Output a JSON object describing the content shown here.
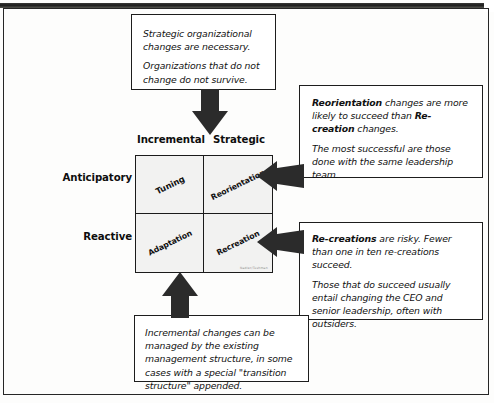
{
  "callouts": {
    "top": {
      "name": "strategic-change-note",
      "paragraphs": [
        "Strategic organizational changes are necessary.",
        "Organizations that do not change do not survive."
      ]
    },
    "right_upper": {
      "name": "reorientation-note",
      "lead_bold": "Reorientation",
      "lead_rest": " changes are more likely to succeed than ",
      "second_bold": "Re-creation",
      "second_rest": " changes.",
      "paragraph2": "The most successful are those done with the same leadership team."
    },
    "right_lower": {
      "name": "re-creation-note",
      "lead_bold": "Re-creations",
      "lead_rest": " are risky. Fewer than one in ten re-creations succeed.",
      "paragraph2": "Those that do succeed usually entail changing the CEO and senior leadership, often with outsiders."
    },
    "bottom": {
      "name": "incremental-change-note",
      "paragraphs": [
        "Incremental changes can be managed by the existing management structure, in some cases with a special \"transition structure\" appended."
      ]
    }
  },
  "matrix": {
    "columns": [
      "Incremental",
      "Strategic"
    ],
    "rows": [
      "Anticipatory",
      "Reactive"
    ],
    "cells": [
      {
        "label": "Tuning",
        "row": "Anticipatory",
        "column": "Incremental"
      },
      {
        "label": "Reorientation",
        "row": "Anticipatory",
        "column": "Strategic"
      },
      {
        "label": "Adaptation",
        "row": "Reactive",
        "column": "Incremental"
      },
      {
        "label": "Recreation",
        "row": "Reactive",
        "column": "Strategic"
      }
    ],
    "credit": "Nadler/Tushman",
    "cell_fill": "#f2f2f1",
    "line_color": "#1b1b1b"
  },
  "arrows": {
    "down": {
      "name": "arrow-down-to-strategic",
      "color": "#2b2b2b"
    },
    "up": {
      "name": "arrow-up-to-adaptation",
      "color": "#2b2b2b"
    },
    "left_upper": {
      "name": "arrow-left-to-reorientation",
      "color": "#2b2b2b"
    },
    "left_lower": {
      "name": "arrow-left-to-recreation",
      "color": "#2b2b2b"
    }
  }
}
